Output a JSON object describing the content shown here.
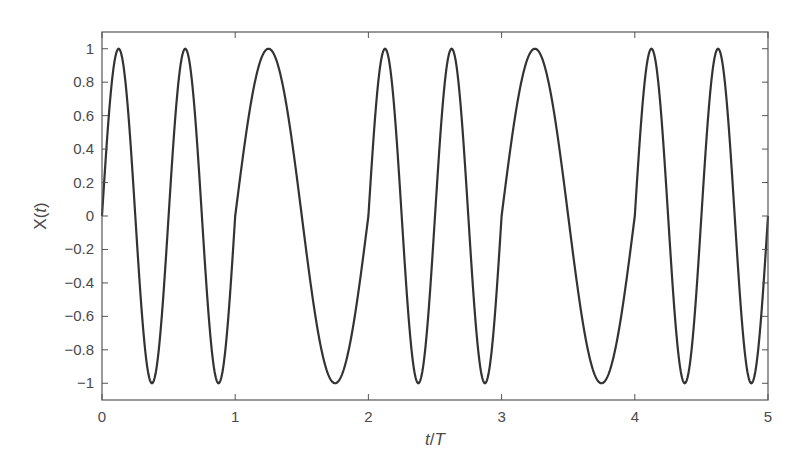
{
  "chart_data": {
    "type": "line",
    "title": "",
    "xlabel": "t/T",
    "ylabel": "X(t)",
    "xlim": [
      0,
      5
    ],
    "ylim": [
      -1.1,
      1.1
    ],
    "grid": false,
    "legend": null,
    "x_ticks": [
      0,
      1,
      2,
      3,
      4,
      5
    ],
    "x_tick_labels": [
      "0",
      "1",
      "2",
      "3",
      "4",
      "5"
    ],
    "y_ticks": [
      1,
      0.8,
      0.6,
      0.4,
      0.2,
      0,
      -0.2,
      -0.4,
      -0.6,
      -0.8,
      -1
    ],
    "y_tick_labels": [
      "1",
      "0.8",
      "0.6",
      "0.4",
      "0.2",
      "0",
      "−0.2",
      "−0.4",
      "−0.6",
      "−0.8",
      "−1"
    ],
    "series": [
      {
        "name": "X(t)",
        "color": "#333333",
        "description": "Piecewise sinusoid: frequency 2/T on intervals [0,1],[2,3],[4,5] and 1/T on [1,2],[3,4]",
        "segments": [
          {
            "t_start": 0,
            "t_end": 1,
            "cycles_per_T": 2
          },
          {
            "t_start": 1,
            "t_end": 2,
            "cycles_per_T": 1
          },
          {
            "t_start": 2,
            "t_end": 3,
            "cycles_per_T": 2
          },
          {
            "t_start": 3,
            "t_end": 4,
            "cycles_per_T": 1
          },
          {
            "t_start": 4,
            "t_end": 5,
            "cycles_per_T": 2
          }
        ],
        "key_points": [
          {
            "t": 0,
            "x": 0
          },
          {
            "t": 0.125,
            "x": 1
          },
          {
            "t": 0.375,
            "x": -1
          },
          {
            "t": 0.625,
            "x": 1
          },
          {
            "t": 0.875,
            "x": -1
          },
          {
            "t": 1,
            "x": 0
          },
          {
            "t": 1.25,
            "x": 1
          },
          {
            "t": 1.75,
            "x": -1
          },
          {
            "t": 2,
            "x": 0
          },
          {
            "t": 2.125,
            "x": 1
          },
          {
            "t": 2.375,
            "x": -1
          },
          {
            "t": 2.625,
            "x": 1
          },
          {
            "t": 2.875,
            "x": -1
          },
          {
            "t": 3,
            "x": 0
          },
          {
            "t": 3.25,
            "x": 1
          },
          {
            "t": 3.75,
            "x": -1
          },
          {
            "t": 4,
            "x": 0
          },
          {
            "t": 4.125,
            "x": 1
          },
          {
            "t": 4.375,
            "x": -1
          },
          {
            "t": 4.625,
            "x": 1
          },
          {
            "t": 4.875,
            "x": -1
          },
          {
            "t": 5,
            "x": 0
          }
        ]
      }
    ]
  },
  "style": {
    "frame_color": "#555555",
    "line_color": "#333333",
    "text_color": "#4a4a4a"
  },
  "layout": {
    "plot_left": 102,
    "plot_right": 768,
    "plot_top": 32,
    "plot_bottom": 400
  },
  "labels": {
    "xlabel_t": "t",
    "xlabel_slash": "/",
    "xlabel_T": "T",
    "ylabel_X": "X(",
    "ylabel_t": "t",
    "ylabel_close": ")"
  }
}
